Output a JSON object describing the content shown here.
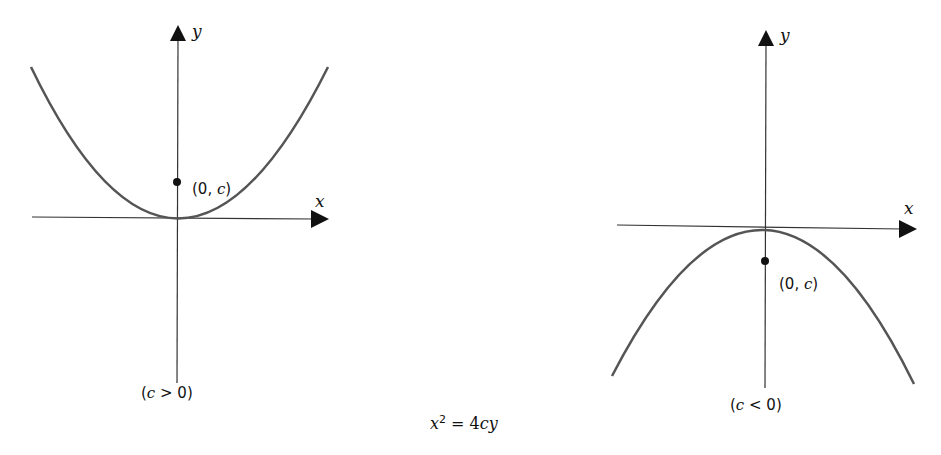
{
  "equation": {
    "lhs_var": "x",
    "exponent": "2",
    "eq": " = 4",
    "rhs": "cy"
  },
  "left_graph": {
    "y_axis_label": "y",
    "x_axis_label": "x",
    "focus_label_open": "(0, ",
    "focus_label_var": "c",
    "focus_label_close": ")",
    "condition_open": "(",
    "condition_var": "c",
    "condition_rest": " > 0)"
  },
  "right_graph": {
    "y_axis_label": "y",
    "x_axis_label": "x",
    "focus_label_open": "(0, ",
    "focus_label_var": "c",
    "focus_label_close": ")",
    "condition_open": "(",
    "condition_var": "c",
    "condition_rest": " < 0)"
  },
  "colors": {
    "curve": "#555555",
    "axis": "#333333",
    "point": "#111111"
  }
}
